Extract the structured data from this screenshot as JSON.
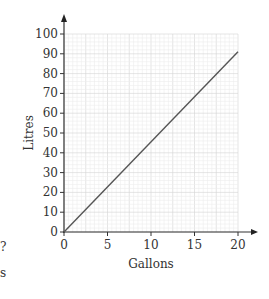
{
  "chart_data": {
    "type": "line",
    "title": "",
    "xlabel": "Gallons",
    "ylabel": "Litres",
    "xlim": [
      0,
      20
    ],
    "ylim": [
      0,
      100
    ],
    "x_ticks": [
      0,
      5,
      10,
      15,
      20
    ],
    "y_ticks": [
      0,
      10,
      20,
      30,
      40,
      50,
      60,
      70,
      80,
      90,
      100
    ],
    "grid": true,
    "legend": null,
    "series": [
      {
        "name": "Gallons to Litres",
        "x": [
          0,
          20
        ],
        "y": [
          0,
          91
        ]
      }
    ]
  },
  "fragments": {
    "left_top": "?",
    "left_bottom": "s"
  }
}
